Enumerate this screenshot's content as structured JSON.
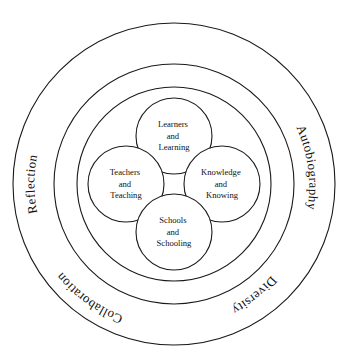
{
  "diagram": {
    "colors": {
      "stroke": "#1a1a1a",
      "background": "#ffffff",
      "text": "#111111"
    },
    "outer_ring_labels": [
      {
        "id": "reflection",
        "text": "Reflection",
        "position": "upper-left"
      },
      {
        "id": "autobiography",
        "text": "Autobiography",
        "position": "upper-right"
      },
      {
        "id": "diversity",
        "text": "Diversity",
        "position": "lower-right"
      },
      {
        "id": "collaboration",
        "text": "Collaboration",
        "position": "lower-left"
      }
    ],
    "nodes": [
      {
        "id": "learners",
        "position": "top",
        "lines": [
          "Learners",
          "and",
          "Learning"
        ]
      },
      {
        "id": "teachers",
        "position": "left",
        "lines": [
          "Teachers",
          "and",
          "Teaching"
        ]
      },
      {
        "id": "knowledge",
        "position": "right",
        "lines": [
          "Knowledge",
          "and",
          "Knowing"
        ]
      },
      {
        "id": "schools",
        "position": "bottom",
        "lines": [
          "Schools",
          "and",
          "Schooling"
        ]
      }
    ],
    "connectors": [
      {
        "id": "teachers-learners",
        "from": "teachers",
        "to": "learners",
        "bidirectional": true
      },
      {
        "id": "learners-knowledge",
        "from": "learners",
        "to": "knowledge",
        "bidirectional": true
      },
      {
        "id": "knowledge-schools",
        "from": "knowledge",
        "to": "schools",
        "bidirectional": true
      },
      {
        "id": "schools-teachers",
        "from": "schools",
        "to": "teachers",
        "bidirectional": true
      }
    ]
  }
}
